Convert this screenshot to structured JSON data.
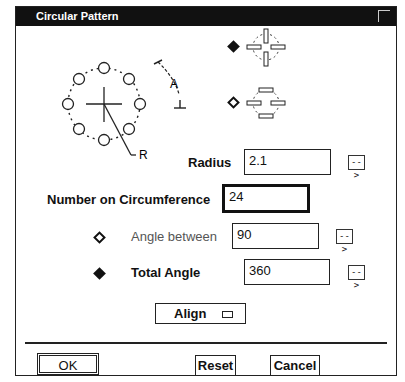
{
  "window": {
    "title": "Circular Pattern"
  },
  "diagram": {
    "angle_label": "A",
    "radius_label": "R"
  },
  "orientation_options": [
    {
      "id": "rotate",
      "selected": true,
      "icon": "rotated-slots-icon"
    },
    {
      "id": "fixed",
      "selected": false,
      "icon": "fixed-slots-icon"
    }
  ],
  "fields": {
    "radius": {
      "label": "Radius",
      "value": "2.1"
    },
    "number": {
      "label": "Number on Circumference",
      "value": "24"
    },
    "angle_between": {
      "label": "Angle between",
      "value": "90",
      "selected": false
    },
    "total_angle": {
      "label": "Total Angle",
      "value": "360",
      "selected": true
    }
  },
  "arrow_button_glyph": "-->",
  "align": {
    "label": "Align"
  },
  "buttons": {
    "ok": "OK",
    "reset": "Reset",
    "cancel": "Cancel"
  }
}
